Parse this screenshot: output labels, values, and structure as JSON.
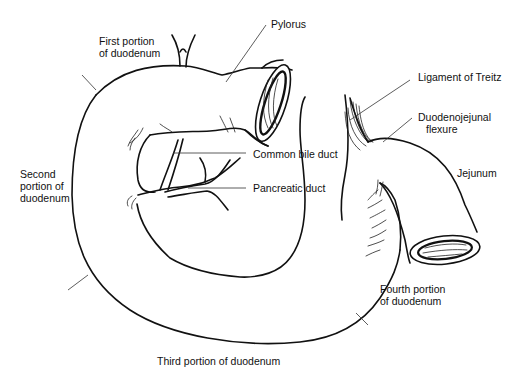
{
  "figure": {
    "labels": {
      "first_portion": [
        "First portion",
        "of duodenum"
      ],
      "pylorus": "Pylorus",
      "ligament_of_treitz": "Ligament of Treitz",
      "duodenojejunal_flexure": [
        "Duodenojejunal",
        "flexure"
      ],
      "jejunum": "Jejunum",
      "common_bile_duct": "Common bile duct",
      "pancreatic_duct": "Pancreatic duct",
      "second_portion": [
        "Second",
        "portion of",
        "duodenum"
      ],
      "fourth_portion": [
        "Fourth portion",
        "of duodenum"
      ],
      "third_portion": "Third portion of duodenum"
    },
    "colors": {
      "line": "#111111",
      "background": "#ffffff"
    }
  }
}
